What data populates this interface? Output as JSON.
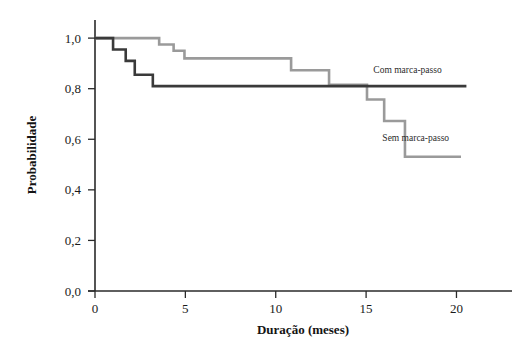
{
  "chart_data": {
    "type": "line",
    "subtype": "kaplan-meier-step",
    "title": "",
    "xlabel": "Duração (meses)",
    "ylabel": "Probabilidade",
    "xlim": [
      0,
      21.8
    ],
    "ylim": [
      0.0,
      1.04
    ],
    "grid": false,
    "legend_position": "inline-right",
    "x_ticks": [
      0,
      5,
      10,
      15,
      20
    ],
    "x_tick_labels": [
      "0",
      "5",
      "10",
      "15",
      "20"
    ],
    "y_ticks": [
      0.0,
      0.2,
      0.4,
      0.6,
      0.8,
      1.0
    ],
    "y_tick_labels": [
      "0,0",
      "0,2",
      "0,4",
      "0,6",
      "0,8",
      "1,0"
    ],
    "series": [
      {
        "name": "Com marca-passo",
        "color": "#3a3a3a",
        "label_x": 15.4,
        "label_y": 0.862,
        "points": [
          {
            "x": 0.0,
            "y": 1.0
          },
          {
            "x": 1.0,
            "y": 1.0
          },
          {
            "x": 1.0,
            "y": 0.955
          },
          {
            "x": 1.7,
            "y": 0.955
          },
          {
            "x": 1.7,
            "y": 0.91
          },
          {
            "x": 2.2,
            "y": 0.91
          },
          {
            "x": 2.2,
            "y": 0.855
          },
          {
            "x": 3.2,
            "y": 0.855
          },
          {
            "x": 3.2,
            "y": 0.81
          },
          {
            "x": 20.55,
            "y": 0.81
          }
        ]
      },
      {
        "name": "Sem marca-passo",
        "color": "#9a9a9a",
        "label_x": 15.9,
        "label_y": 0.594,
        "points": [
          {
            "x": 0.0,
            "y": 1.0
          },
          {
            "x": 3.55,
            "y": 1.0
          },
          {
            "x": 3.55,
            "y": 0.975
          },
          {
            "x": 4.35,
            "y": 0.975
          },
          {
            "x": 4.35,
            "y": 0.95
          },
          {
            "x": 4.95,
            "y": 0.95
          },
          {
            "x": 4.95,
            "y": 0.92
          },
          {
            "x": 10.85,
            "y": 0.92
          },
          {
            "x": 10.85,
            "y": 0.873
          },
          {
            "x": 12.95,
            "y": 0.873
          },
          {
            "x": 12.95,
            "y": 0.815
          },
          {
            "x": 15.05,
            "y": 0.815
          },
          {
            "x": 15.05,
            "y": 0.757
          },
          {
            "x": 16.0,
            "y": 0.757
          },
          {
            "x": 16.0,
            "y": 0.672
          },
          {
            "x": 17.15,
            "y": 0.672
          },
          {
            "x": 17.15,
            "y": 0.531
          },
          {
            "x": 20.25,
            "y": 0.531
          }
        ]
      }
    ]
  },
  "axes": {
    "x_axis_name": "duration-axis",
    "y_axis_name": "probability-axis"
  },
  "colors": {
    "axis": "#2a2a2a",
    "background": "#ffffff",
    "series_dark": "#3a3a3a",
    "series_light": "#9a9a9a"
  }
}
